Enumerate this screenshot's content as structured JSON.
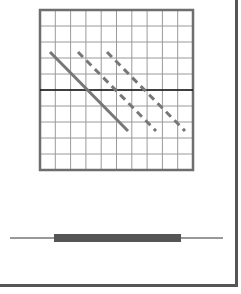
{
  "diagram": {
    "grid": {
      "x": 40,
      "y": 10,
      "width": 153,
      "height": 160,
      "columns": 10,
      "rows": 10,
      "border_color": "#6e6e6e",
      "line_color": "#9a9a9a",
      "axis_y": 90,
      "axis_color": "#111111"
    },
    "lines": [
      {
        "style": "solid",
        "x1": 50,
        "y1": 52,
        "x2": 128,
        "y2": 131,
        "color": "#777777"
      },
      {
        "style": "dashed",
        "x1": 78,
        "y1": 52,
        "x2": 156,
        "y2": 131,
        "color": "#777777"
      },
      {
        "style": "dashed",
        "x1": 107,
        "y1": 52,
        "x2": 185,
        "y2": 131,
        "color": "#777777"
      }
    ],
    "range_bar": {
      "line_x1": 10,
      "line_x2": 223,
      "line_y": 238,
      "bar_x": 54,
      "bar_width": 127,
      "bar_y": 234,
      "bar_height": 8,
      "line_color": "#333333",
      "bar_color": "#555555"
    }
  }
}
